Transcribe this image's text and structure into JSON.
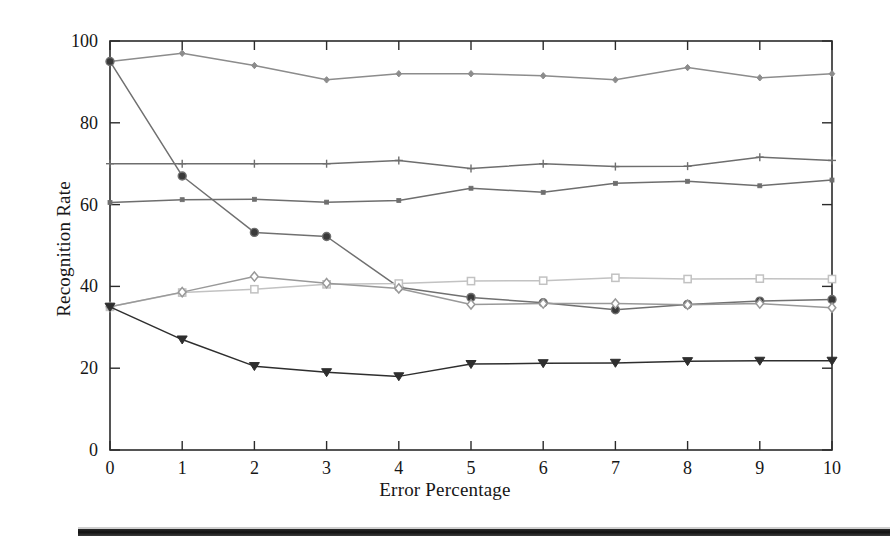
{
  "chart_data": {
    "type": "line",
    "title": "",
    "xlabel": "Error Percentage",
    "ylabel": "Recognition Rate",
    "x": [
      0,
      1,
      2,
      3,
      4,
      5,
      6,
      7,
      8,
      9,
      10
    ],
    "xlim": [
      0,
      10
    ],
    "ylim": [
      0,
      100
    ],
    "xticks": [
      "0",
      "1",
      "2",
      "3",
      "4",
      "5",
      "6",
      "7",
      "8",
      "9",
      "10"
    ],
    "yticks": [
      "0",
      "20",
      "40",
      "60",
      "80",
      "100"
    ],
    "grid": false,
    "legend": "none",
    "series": [
      {
        "name": "series-1",
        "marker": "diamond-small",
        "color": "#8c8c8c",
        "values": [
          95.0,
          97.0,
          94.0,
          90.5,
          92.0,
          92.0,
          91.5,
          90.5,
          93.5,
          91.0,
          92.0
        ]
      },
      {
        "name": "series-2",
        "marker": "plus",
        "color": "#6e6e6e",
        "values": [
          70.0,
          70.0,
          70.0,
          70.0,
          70.8,
          68.8,
          70.0,
          69.3,
          69.4,
          71.6,
          70.8
        ]
      },
      {
        "name": "series-3",
        "marker": "dot",
        "color": "#6e6e6e",
        "values": [
          60.5,
          61.2,
          61.3,
          60.6,
          61.0,
          64.0,
          63.0,
          65.2,
          65.7,
          64.6,
          66.0
        ]
      },
      {
        "name": "series-4",
        "marker": "circle-filled",
        "color": "#707070",
        "values": [
          95.0,
          67.0,
          53.2,
          52.2,
          39.8,
          37.3,
          36.0,
          34.3,
          35.6,
          36.4,
          36.8
        ]
      },
      {
        "name": "series-5",
        "marker": "square-open",
        "color": "#c2c2c2",
        "values": [
          35.0,
          38.5,
          39.3,
          40.5,
          40.7,
          41.3,
          41.4,
          42.1,
          41.8,
          41.9,
          41.8
        ]
      },
      {
        "name": "series-6",
        "marker": "diamond-open",
        "color": "#999999",
        "values": [
          35.0,
          38.6,
          42.4,
          40.8,
          39.5,
          35.6,
          35.8,
          35.8,
          35.5,
          35.8,
          34.8
        ]
      },
      {
        "name": "series-7",
        "marker": "triangle-down",
        "color": "#2e2e2e",
        "values": [
          35.0,
          27.0,
          20.5,
          19.0,
          18.0,
          21.0,
          21.2,
          21.3,
          21.7,
          21.8,
          21.8
        ]
      }
    ]
  },
  "axes": {
    "x_axis_label": "Error Percentage",
    "y_axis_label": "Recognition Rate"
  }
}
